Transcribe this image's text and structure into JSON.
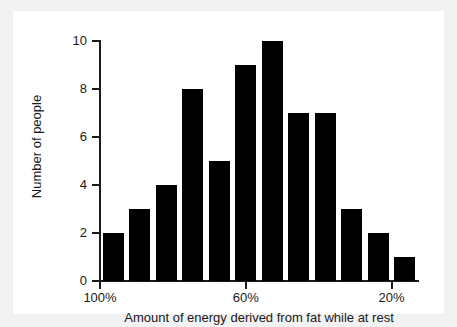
{
  "chart_data": {
    "type": "bar",
    "title": "",
    "subtitle": "",
    "xlabel": "Amount of energy derived from fat while at rest",
    "ylabel": "Number of people",
    "categories": [
      "100%",
      "",
      "",
      "",
      "",
      "60%",
      "",
      "",
      "",
      "",
      "",
      "20%"
    ],
    "values": [
      2,
      3,
      4,
      8,
      5,
      9,
      10,
      7,
      7,
      3,
      2,
      1
    ],
    "ylim": [
      0,
      10
    ],
    "ytick_labels": [
      "0",
      "2",
      "4",
      "6",
      "8",
      "10"
    ],
    "ytick_values": [
      0,
      2,
      4,
      6,
      8,
      10
    ],
    "xtick_labels": [
      "100%",
      "60%",
      "20%"
    ],
    "xtick_positions": [
      0,
      5.5,
      11
    ],
    "grid": false,
    "legend": false,
    "bar_color": "#000000",
    "axis_color": "#1a1a1a",
    "background_color": "#ffffff",
    "frame_color": "#f2f2f2",
    "n_bars": 12,
    "annotations": []
  }
}
